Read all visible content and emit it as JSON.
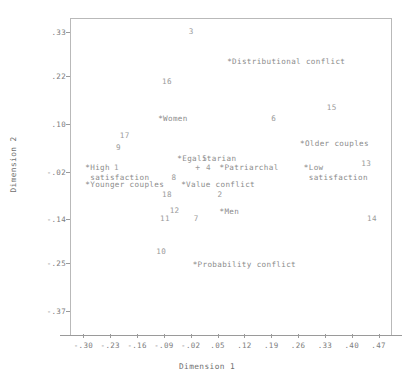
{
  "chart_data": {
    "type": "scatter",
    "title": "",
    "xlabel": "Dimension 1",
    "ylabel": "Dimension 2",
    "xticks": [
      "-.30",
      "-.23",
      "-.16",
      "-.09",
      "-.02",
      ".05",
      ".12",
      ".19",
      ".26",
      ".33",
      ".40",
      ".47"
    ],
    "yticks": [
      ".33",
      ".22",
      ".10",
      "-.02",
      "-.14",
      "-.25",
      "-.37"
    ],
    "xlim": [
      -0.335,
      0.505
    ],
    "ylim": [
      -0.43,
      0.365
    ],
    "grid": false,
    "legend": null,
    "series": [
      {
        "name": "Category labels",
        "marker": "asterisk-prefixed-text",
        "points": [
          {
            "label": "*Distributional conflict",
            "x": 0.075,
            "y": 0.255
          },
          {
            "label": "*Women",
            "x": -0.105,
            "y": 0.112
          },
          {
            "label": "*Older couples",
            "x": 0.265,
            "y": 0.048
          },
          {
            "label": "*Egalitarian",
            "x": -0.055,
            "y": 0.012
          },
          {
            "label": "*Patriarchal",
            "x": 0.055,
            "y": -0.012
          },
          {
            "label": "*High\n satisfaction",
            "x": -0.295,
            "y": -0.012
          },
          {
            "label": "*Low\n satisfaction",
            "x": 0.275,
            "y": -0.012
          },
          {
            "label": "*Younger couples",
            "x": -0.295,
            "y": -0.055
          },
          {
            "label": "*Value conflict",
            "x": -0.045,
            "y": -0.055
          },
          {
            "label": "*Men",
            "x": 0.055,
            "y": -0.122
          },
          {
            "label": "*Probability conflict",
            "x": -0.015,
            "y": -0.255
          }
        ]
      },
      {
        "name": "Numbered points",
        "marker": "number-text",
        "points": [
          {
            "label": "3",
            "x": -0.025,
            "y": 0.33
          },
          {
            "label": "16",
            "x": -0.095,
            "y": 0.205
          },
          {
            "label": "15",
            "x": 0.335,
            "y": 0.14
          },
          {
            "label": "6",
            "x": 0.19,
            "y": 0.112
          },
          {
            "label": "17",
            "x": -0.205,
            "y": 0.068
          },
          {
            "label": "9",
            "x": -0.215,
            "y": 0.038
          },
          {
            "label": "13",
            "x": 0.425,
            "y": 0.0
          },
          {
            "label": "5",
            "x": 0.01,
            "y": 0.012
          },
          {
            "label": "4",
            "x": 0.02,
            "y": -0.012
          },
          {
            "label": "1",
            "x": -0.22,
            "y": -0.012
          },
          {
            "label": "8",
            "x": -0.07,
            "y": -0.036
          },
          {
            "label": "18",
            "x": -0.095,
            "y": -0.08
          },
          {
            "label": "2",
            "x": 0.05,
            "y": -0.08
          },
          {
            "label": "12",
            "x": -0.075,
            "y": -0.118
          },
          {
            "label": "14",
            "x": 0.44,
            "y": -0.14
          },
          {
            "label": "11",
            "x": -0.1,
            "y": -0.14
          },
          {
            "label": "7",
            "x": -0.012,
            "y": -0.14
          },
          {
            "label": "10",
            "x": -0.11,
            "y": -0.222
          }
        ]
      },
      {
        "name": "Origin marker",
        "marker": "plus",
        "points": [
          {
            "label": "+",
            "x": -0.008,
            "y": -0.012
          }
        ]
      }
    ]
  },
  "axes": {
    "x_title": "Dimension 1",
    "y_title": "Dimension 2"
  }
}
